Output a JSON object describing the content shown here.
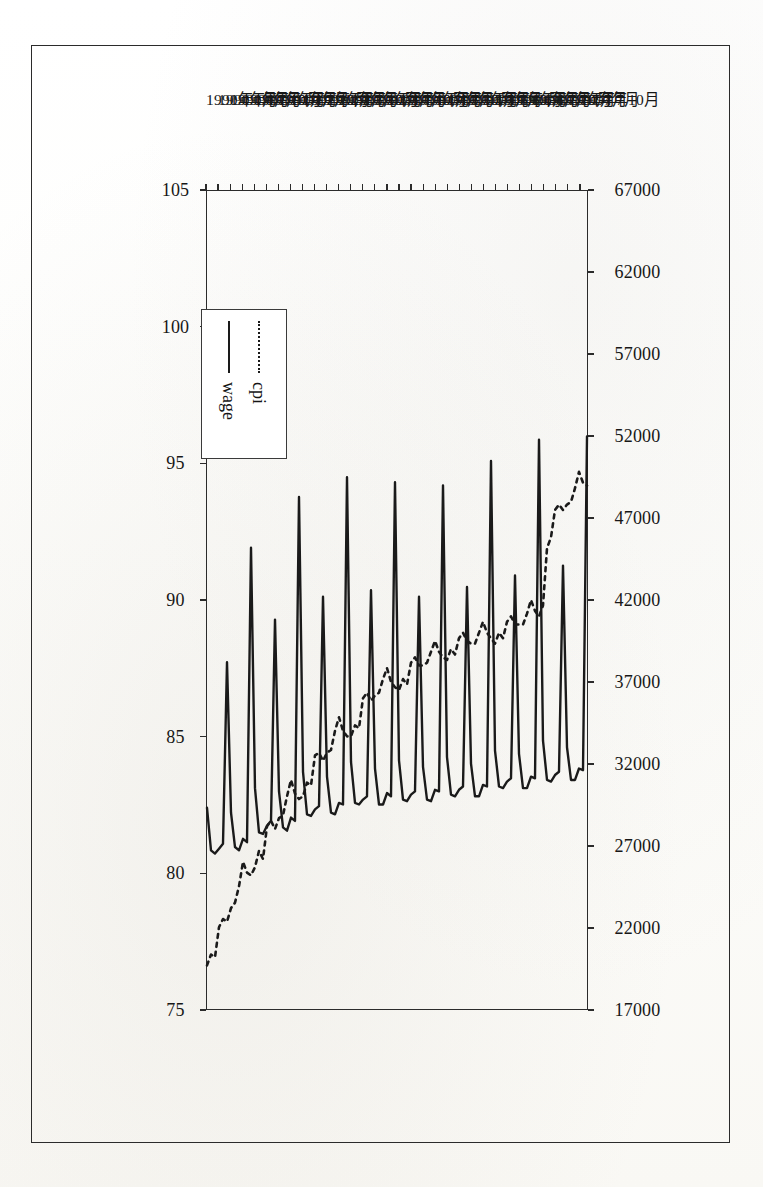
{
  "figure": {
    "kind": "scanned-line-chart",
    "orientation_note": "printed rotated 90 degrees on the page"
  },
  "legend": {
    "items": [
      {
        "label": "cpi",
        "style": "dotted",
        "color": "#1a1a1a"
      },
      {
        "label": "wage",
        "style": "solid",
        "color": "#1a1a1a"
      }
    ]
  },
  "chart_data": {
    "type": "line",
    "title": "",
    "xlabel": "",
    "ylabel": "",
    "grid": false,
    "legend_position": "inside-left",
    "rotated_degrees": 90,
    "x": [
      "1990年1月",
      "1990年2月",
      "1990年3月",
      "1990年4月",
      "1990年5月",
      "1990年6月",
      "1990年7月",
      "1990年8月",
      "1990年9月",
      "1990年10月",
      "1990年11月",
      "1990年12月",
      "1991年1月",
      "1991年2月",
      "1991年3月",
      "1991年4月",
      "1991年5月",
      "1991年6月",
      "1991年7月",
      "1991年8月",
      "1991年9月",
      "1991年10月",
      "1991年11月",
      "1991年12月",
      "1992年1月",
      "1992年2月",
      "1992年3月",
      "1992年4月",
      "1992年5月",
      "1992年6月",
      "1992年7月",
      "1992年8月",
      "1992年9月",
      "1992年10月",
      "1992年11月",
      "1992年12月",
      "1993年1月",
      "1993年2月",
      "1993年3月",
      "1993年4月",
      "1993年5月",
      "1993年6月",
      "1993年7月",
      "1993年8月",
      "1993年9月",
      "1993年10月",
      "1993年11月",
      "1993年12月",
      "1994年1月",
      "1994年2月",
      "1994年3月",
      "1994年4月",
      "1994年5月",
      "1994年6月",
      "1994年7月",
      "1994年8月",
      "1994年9月",
      "1994年10月",
      "1994年11月",
      "1994年12月",
      "1995年1月",
      "1995年2月",
      "1995年3月",
      "1995年4月",
      "1995年5月",
      "1995年6月",
      "1995年7月",
      "1995年8月",
      "1995年9月",
      "1995年10月",
      "1995年11月",
      "1995年12月",
      "1996年1月",
      "1996年2月",
      "1996年3月",
      "1996年4月",
      "1996年5月",
      "1996年6月",
      "1996年7月",
      "1996年8月",
      "1996年9月",
      "1996年10月",
      "1996年11月",
      "1996年12月",
      "1997年1月",
      "1997年2月",
      "1997年3月",
      "1997年4月",
      "1997年5月",
      "1997年6月",
      "1997年7月",
      "1997年8月",
      "1997年9月",
      "1997年10月",
      "1997年11月",
      "1997年12月"
    ],
    "x_tick_labels": [
      "1990年1月",
      "1990年4月",
      "1990年7月",
      "1990年10月",
      "1991年1月",
      "1991年4月",
      "1991年7月",
      "1991年10月",
      "1992年1月",
      "1992年4月",
      "1992年7月",
      "1992年10月",
      "1993年1月",
      "1993年4月",
      "1993年7月",
      "1993年10月",
      "1994年1月",
      "1994年4月",
      "1994年7月",
      "1994年10月",
      "1995年1月",
      "1995年4月",
      "1995年7月",
      "1995年10月",
      "1996年1月",
      "1996年4月",
      "1996年7月",
      "1996年10月",
      "1997年1月",
      "1997年4月",
      "1997年7月",
      "1997年10月"
    ],
    "x_tick_every": 3,
    "series": [
      {
        "name": "wage",
        "axis": "primary",
        "style": "solid",
        "color": "#1a1a1a",
        "unit": "",
        "values": [
          29300,
          26700,
          26500,
          26800,
          27100,
          38200,
          29000,
          26900,
          26700,
          27400,
          27200,
          45200,
          30500,
          27800,
          27700,
          28200,
          28500,
          40800,
          30300,
          28100,
          27900,
          28700,
          28500,
          48300,
          31500,
          28900,
          28800,
          29200,
          29400,
          42200,
          31200,
          29000,
          28900,
          29600,
          29500,
          49500,
          32100,
          29600,
          29500,
          29800,
          30000,
          42600,
          31700,
          29500,
          29500,
          30200,
          30000,
          49200,
          32200,
          29800,
          29700,
          30100,
          30300,
          42200,
          31800,
          29800,
          29700,
          30400,
          30300,
          49000,
          32400,
          30100,
          30000,
          30400,
          30600,
          42800,
          32000,
          30000,
          30000,
          30700,
          30600,
          50500,
          32800,
          30600,
          30500,
          30900,
          31100,
          43500,
          32600,
          30500,
          30500,
          31200,
          31100,
          51800,
          33400,
          31000,
          30900,
          31300,
          31500,
          44100,
          33000,
          31000,
          31000,
          31700,
          31600,
          52000
        ]
      },
      {
        "name": "cpi",
        "axis": "secondary",
        "style": "dotted",
        "color": "#1a1a1a",
        "unit": "",
        "values": [
          76.6,
          77.0,
          76.9,
          78.0,
          78.3,
          78.2,
          78.7,
          78.9,
          79.5,
          80.4,
          80.0,
          79.9,
          80.2,
          80.8,
          80.5,
          81.7,
          81.9,
          81.6,
          82.0,
          82.1,
          82.8,
          83.4,
          82.9,
          82.7,
          82.8,
          83.3,
          83.2,
          84.3,
          84.4,
          84.1,
          84.4,
          84.5,
          85.2,
          85.7,
          85.2,
          85.0,
          85.0,
          85.4,
          85.3,
          86.4,
          86.6,
          86.3,
          86.5,
          86.6,
          87.1,
          87.5,
          87.0,
          86.8,
          86.7,
          87.1,
          86.9,
          87.7,
          87.9,
          87.6,
          87.6,
          87.7,
          88.1,
          88.5,
          88.1,
          87.9,
          87.8,
          88.2,
          88.0,
          88.6,
          88.8,
          88.5,
          88.4,
          88.4,
          88.8,
          89.2,
          88.8,
          88.6,
          88.4,
          88.8,
          88.6,
          89.2,
          89.4,
          89.1,
          89.1,
          89.1,
          89.5,
          90.0,
          89.6,
          89.4,
          89.8,
          91.9,
          92.3,
          93.3,
          93.5,
          93.3,
          93.5,
          93.6,
          94.1,
          94.7,
          94.3,
          94.2
        ]
      }
    ],
    "primary_axis": {
      "name": "wage",
      "min": 17000,
      "max": 67000,
      "step": 5000,
      "ticks": [
        67000,
        62000,
        57000,
        52000,
        47000,
        42000,
        37000,
        32000,
        27000,
        22000,
        17000
      ],
      "tick_labels": [
        "67000",
        "62000",
        "57000",
        "52000",
        "47000",
        "42000",
        "37000",
        "32000",
        "27000",
        "22000",
        "17000"
      ],
      "position": "top-of-page",
      "direction": "descending-left-to-right"
    },
    "secondary_axis": {
      "name": "cpi",
      "min": 75,
      "max": 105,
      "step": 5,
      "ticks": [
        105,
        100,
        95,
        90,
        85,
        80,
        75
      ],
      "tick_labels": [
        "105",
        "100",
        "95",
        "90",
        "85",
        "80",
        "75"
      ],
      "position": "bottom-of-page",
      "direction": "descending-left-to-right"
    }
  }
}
